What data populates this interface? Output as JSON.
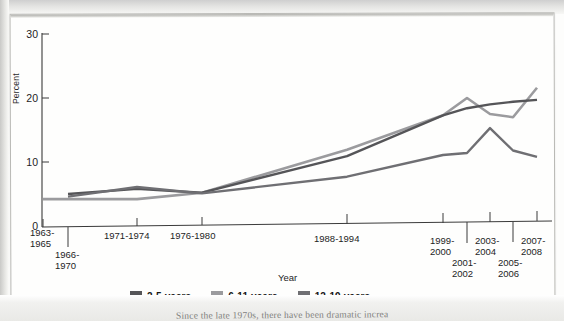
{
  "figure": {
    "ylabel": "Percent",
    "xlabel": "Year",
    "caption": "Since the late 1970s, there have been dramatic increa"
  },
  "axes": {
    "y_ticks": [
      "0",
      "10",
      "20",
      "30"
    ],
    "x_ticks": [
      "1963-\n1965",
      "1966-\n1970",
      "1971-1974",
      "1976-1980",
      "1988-1994",
      "1999-\n2000",
      "2001-\n2002",
      "2003-\n2004",
      "2005-\n2006",
      "2007-\n2008"
    ]
  },
  "legend": [
    {
      "label": "2-5 years",
      "color": "#555558"
    },
    {
      "label": "6-11 years",
      "color": "#9b9b9e"
    },
    {
      "label": "12-19 years",
      "color": "#6f6f73"
    }
  ],
  "chart_data": {
    "type": "line",
    "title": "",
    "xlabel": "Year",
    "ylabel": "Percent",
    "ylim": [
      0,
      30
    ],
    "grid": false,
    "legend_position": "bottom",
    "categories": [
      "1963-1965",
      "1966-1970",
      "1971-1974",
      "1976-1980",
      "1988-1994",
      "1999-2000",
      "2001-2002",
      "2003-2004",
      "2005-2006",
      "2007-2008"
    ],
    "series": [
      {
        "name": "2-5 years",
        "color": "#555558",
        "x": [
          "1966-1970",
          "1971-1974",
          "1976-1980",
          "1988-1994",
          "1999-2000",
          "2001-2002",
          "2003-2004",
          "2005-2006",
          "2007-2008"
        ],
        "values": [
          5.0,
          5.8,
          5.2,
          10.9,
          17.3,
          18.4,
          19.0,
          19.4,
          19.7
        ]
      },
      {
        "name": "6-11 years",
        "color": "#9b9b9e",
        "x": [
          "1963-1965",
          "1971-1974",
          "1976-1980",
          "1988-1994",
          "1999-2000",
          "2001-2002",
          "2003-2004",
          "2005-2006",
          "2007-2008"
        ],
        "values": [
          4.2,
          4.2,
          5.2,
          11.9,
          17.3,
          20.0,
          17.5,
          17.0,
          21.6
        ]
      },
      {
        "name": "12-19 years",
        "color": "#6f6f73",
        "x": [
          "1966-1970",
          "1971-1974",
          "1976-1980",
          "1988-1994",
          "1999-2000",
          "2001-2002",
          "2003-2004",
          "2005-2006",
          "2007-2008"
        ],
        "values": [
          4.6,
          6.1,
          5.1,
          7.7,
          11.1,
          11.4,
          15.3,
          11.8,
          10.8
        ]
      }
    ]
  }
}
